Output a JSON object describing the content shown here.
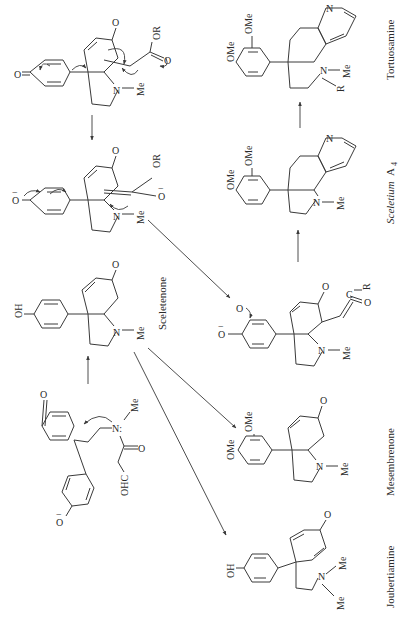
{
  "figure": {
    "orientation": "rotated-90-ccw",
    "colors": {
      "ink": "#3a3a3a",
      "background": "#ffffff"
    }
  },
  "compounds": {
    "precursor": {
      "label": "",
      "atoms": {
        "oxo": "O",
        "phenoxide": "O",
        "phenoxide_charge": "−",
        "amine_n": "N:",
        "amine_me": "Me",
        "aldehyde": "OHC",
        "carbonyl_o": "O"
      }
    },
    "sceletenone": {
      "label": "Sceletenone",
      "atoms": {
        "oh": "OH",
        "oxo": "O",
        "n": "N",
        "me": "Me"
      }
    },
    "dienone_intermediate": {
      "label": "",
      "atoms": {
        "oxo1": "O",
        "oxo2": "O",
        "or": "OR",
        "o_minus": "O",
        "o_charge": "−",
        "n": "N",
        "me": "Me"
      }
    },
    "enolate_intermediate": {
      "label": "",
      "atoms": {
        "phenoxide": "O",
        "phenoxide_charge": "−",
        "oxo": "O",
        "or": "OR",
        "o_minus": "O",
        "o_charge": "−",
        "n": "N",
        "me": "Me"
      }
    },
    "catechol_intermediate": {
      "label": "",
      "atoms": {
        "o_minus": "O",
        "o_charge": "−",
        "o_radical": "O",
        "oxo": "O",
        "c": "C",
        "r": "R",
        "co": "O",
        "n": "N",
        "me": "Me"
      }
    },
    "joubertiamine": {
      "label": "Joubertiamine",
      "atoms": {
        "oh": "OH",
        "oxo": "O",
        "n": "N",
        "me1": "Me",
        "me2": "Me"
      }
    },
    "mesembrenone": {
      "label": "Mesembrenone",
      "atoms": {
        "ome1": "OMe",
        "ome2": "OMe",
        "oxo": "O",
        "n": "N",
        "me": "Me"
      }
    },
    "sceletium_a4": {
      "label_main": "Sceletium",
      "label_sub": "A",
      "label_subscript": "4",
      "atoms": {
        "ome1": "OMe",
        "ome2": "OMe",
        "n_pyr": "N",
        "n": "N",
        "me": "Me"
      }
    },
    "tortuosamine": {
      "label": "Tortuosamine",
      "atoms": {
        "ome1": "OMe",
        "ome2": "OMe",
        "n_pyr": "N",
        "n": "N",
        "r": "R",
        "me": "Me"
      }
    }
  }
}
